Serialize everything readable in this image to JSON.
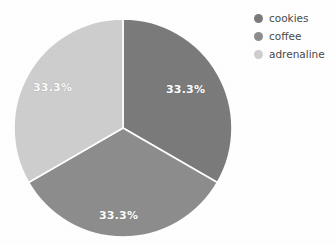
{
  "chart_data": {
    "type": "pie",
    "title": "",
    "categories": [
      "cookies",
      "coffee",
      "adrenaline"
    ],
    "values": [
      33.3,
      33.3,
      33.3
    ],
    "value_labels": [
      "33.3%",
      "33.3%",
      "33.3%"
    ],
    "colors": [
      "#7b7b7b",
      "#8d8d8d",
      "#cecece"
    ],
    "slice_label_color": "#ffffff",
    "start_angle_deg": 0,
    "direction": "clockwise",
    "legend_position": "right",
    "legend_entries": [
      {
        "label": "cookies",
        "color": "#7b7b7b"
      },
      {
        "label": "coffee",
        "color": "#8d8d8d"
      },
      {
        "label": "adrenaline",
        "color": "#cecece"
      }
    ],
    "background": "#ffffff",
    "grid": false,
    "xlabel": "",
    "ylabel": ""
  },
  "pie": {
    "slices": [
      {
        "name": "cookies",
        "percent_label": "33.3%",
        "color": "#7b7b7b"
      },
      {
        "name": "coffee",
        "percent_label": "33.3%",
        "color": "#8d8d8d"
      },
      {
        "name": "adrenaline",
        "percent_label": "33.3%",
        "color": "#cecece"
      }
    ]
  },
  "legend": {
    "items": [
      {
        "label": "cookies",
        "color": "#7b7b7b"
      },
      {
        "label": "coffee",
        "color": "#8d8d8d"
      },
      {
        "label": "adrenaline",
        "color": "#cecece"
      }
    ]
  }
}
